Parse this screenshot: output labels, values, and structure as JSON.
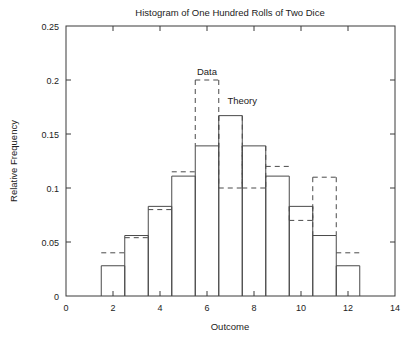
{
  "chart_data": {
    "type": "bar",
    "title": "Histogram of One Hundred Rolls of Two Dice",
    "xlabel": "Outcome",
    "ylabel": "Relative Frequency",
    "xlim": [
      0,
      14
    ],
    "ylim": [
      0,
      0.25
    ],
    "xticks": [
      0,
      2,
      4,
      6,
      8,
      10,
      12,
      14
    ],
    "xtick_labels": [
      "0",
      "2",
      "4",
      "6",
      "8",
      "10",
      "12",
      "14"
    ],
    "yticks": [
      0,
      0.05,
      0.1,
      0.15,
      0.2,
      0.25
    ],
    "ytick_labels": [
      "0",
      "0.05",
      "0.1",
      "0.15",
      "0.2",
      "0.25"
    ],
    "grid": false,
    "legend_position": "inline-annotations",
    "categories": [
      2,
      3,
      4,
      5,
      6,
      7,
      8,
      9,
      10,
      11,
      12
    ],
    "bar_width": 1,
    "series": [
      {
        "name": "Theory",
        "style": "solid",
        "values": [
          0.028,
          0.056,
          0.083,
          0.111,
          0.139,
          0.167,
          0.139,
          0.111,
          0.083,
          0.056,
          0.028
        ]
      },
      {
        "name": "Data",
        "style": "dashed",
        "values": [
          0.04,
          0.054,
          0.08,
          0.115,
          0.2,
          0.1,
          0.1,
          0.12,
          0.07,
          0.11,
          0.04
        ]
      }
    ],
    "annotations": [
      {
        "text": "Data",
        "x": 6,
        "y": 0.205
      },
      {
        "text": "Theory",
        "x": 7.5,
        "y": 0.178
      }
    ]
  }
}
